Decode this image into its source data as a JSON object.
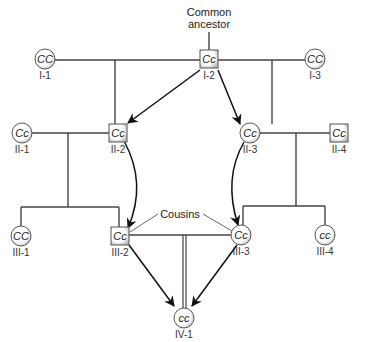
{
  "annotations": {
    "common_ancestor_line1": "Common",
    "common_ancestor_line2": "ancestor",
    "cousins": "Cousins"
  },
  "individuals": [
    {
      "id": "I-1",
      "genotype": "CC",
      "sex": "female",
      "shape": "circle"
    },
    {
      "id": "I-2",
      "genotype": "Cc",
      "sex": "male",
      "shape": "square"
    },
    {
      "id": "I-3",
      "genotype": "CC",
      "sex": "female",
      "shape": "circle"
    },
    {
      "id": "II-1",
      "genotype": "Cc",
      "sex": "female",
      "shape": "circle"
    },
    {
      "id": "II-2",
      "genotype": "Cc",
      "sex": "male",
      "shape": "square"
    },
    {
      "id": "II-3",
      "genotype": "Cc",
      "sex": "female",
      "shape": "circle"
    },
    {
      "id": "II-4",
      "genotype": "Cc",
      "sex": "male",
      "shape": "square"
    },
    {
      "id": "III-1",
      "genotype": "CC",
      "sex": "female",
      "shape": "circle"
    },
    {
      "id": "III-2",
      "genotype": "Cc",
      "sex": "male",
      "shape": "square"
    },
    {
      "id": "III-3",
      "genotype": "Cc",
      "sex": "female",
      "shape": "circle"
    },
    {
      "id": "III-4",
      "genotype": "cc",
      "sex": "female",
      "shape": "circle"
    },
    {
      "id": "IV-1",
      "genotype": "cc",
      "sex": "female",
      "shape": "circle"
    }
  ],
  "allele_paths": [
    {
      "from": "I-2",
      "to": "II-2"
    },
    {
      "from": "I-2",
      "to": "II-3"
    },
    {
      "from": "II-2",
      "to": "III-2"
    },
    {
      "from": "II-3",
      "to": "III-3"
    },
    {
      "from": "III-2",
      "to": "IV-1"
    },
    {
      "from": "III-3",
      "to": "IV-1"
    }
  ]
}
